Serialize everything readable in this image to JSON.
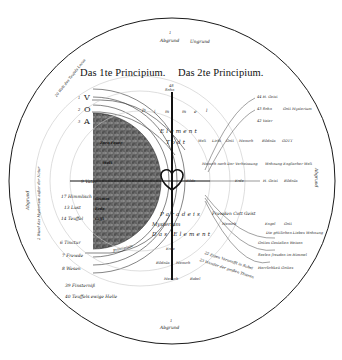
{
  "diagram": {
    "title_left": "Das 1te Principium.",
    "title_right": "Das 2te Principium.",
    "top": {
      "num": "1",
      "label": "Abgrund",
      "sub": "Ungrund"
    },
    "bottom": {
      "num": "1",
      "label": "Abgrund"
    },
    "left_edge": {
      "num": "1",
      "label": "Abgrund",
      "sub": "2 Wund das Mysterium außer der Natur"
    },
    "right_edge": {
      "label": "Abgrund"
    },
    "top_left_arc": "20 Welt des Teufels Locus",
    "center_axis": {
      "top_label": "Sohn",
      "top_num": "48",
      "heart_label": "Hertz"
    },
    "left_symbols": [
      {
        "num": "1",
        "glyph": "V"
      },
      {
        "num": "2",
        "glyph": "O"
      },
      {
        "num": "3",
        "glyph": "A"
      }
    ],
    "left_labels": [
      {
        "num": "9",
        "text": "Vater"
      },
      {
        "num": "17",
        "text": "Himmlisch"
      },
      {
        "num": "13",
        "text": "Lust"
      },
      {
        "num": "14",
        "text": "Teuffel"
      },
      {
        "num": "6",
        "text": "Tinctur"
      },
      {
        "num": "7",
        "text": "Frewde"
      },
      {
        "num": "8",
        "text": "Wesen"
      },
      {
        "num": "39",
        "text": "Finsterniß"
      },
      {
        "num": "40",
        "text": "Teuffels ewige Helle"
      }
    ],
    "dark_hemisphere_labels": [
      "Zorn Feuer",
      "Welt",
      "Erde",
      "Grimm",
      "Teufel",
      "Gifft",
      "Principium"
    ],
    "arc_letters": [
      "D",
      "i",
      "m",
      "m",
      "e",
      "l"
    ],
    "middle_band": {
      "element": "Element",
      "tod": "Todt",
      "paradeis": "Paradeis",
      "mysterium": "Mysterium",
      "das_element": "Das Element"
    },
    "right_top_labels": [
      {
        "num": "44",
        "text": "H. Geist"
      },
      {
        "num": "43",
        "text": "Sohn",
        "extra": "Gott Mysterium"
      },
      {
        "num": "42",
        "text": "Vater"
      }
    ],
    "right_row1": [
      {
        "num": "29",
        "text": "Welt"
      },
      {
        "num": "30",
        "text": "Licht"
      },
      {
        "num": "31",
        "text": "Gott"
      },
      {
        "num": "32",
        "text": "Mensch"
      },
      {
        "num": "33",
        "text": "Bildnüs"
      },
      {
        "num": "34",
        "text": "GOTT"
      }
    ],
    "right_row2": [
      {
        "num": "35",
        "text": "Mensch nach Der Verheissung"
      },
      {
        "num": "36",
        "text": "Wohnung Englischer Welt"
      }
    ],
    "right_row3": [
      {
        "num": "37",
        "text": "Bilde"
      },
      {
        "num": "38",
        "text": "Erde"
      },
      {
        "num": "15",
        "text": "H. Geist"
      },
      {
        "num": "16",
        "text": "Bildnüs"
      }
    ],
    "lower_center": [
      {
        "num": "18",
        "text": "Frewden Cott Geist"
      },
      {
        "num": "52",
        "text": "Mensch"
      },
      {
        "num": "53",
        "text": "Engel"
      },
      {
        "num": "54",
        "text": "Gott"
      },
      {
        "num": "55",
        "text": "Die göttlichen Liebes Wohnung"
      },
      {
        "num": "45",
        "text": "Erde"
      },
      {
        "num": "46",
        "text": "Bildnüs"
      },
      {
        "num": "47",
        "text": "Mensch"
      },
      {
        "num": "26",
        "text": "Mensch"
      },
      {
        "num": "27",
        "text": "Babel"
      }
    ],
    "lower_right": [
      {
        "num": "49",
        "text": "Gottes Gestalten Weisen"
      },
      {
        "num": "50",
        "text": "Seelen freuden im Himmel"
      },
      {
        "num": "51",
        "text": "Herrlichkeit Gottes"
      }
    ],
    "diagonal_notes": [
      "22 Eigen Vernunfft in Babel",
      "23 Wunder der großen Thieren"
    ]
  },
  "colors": {
    "ink": "#1a1a1a",
    "paper": "#ffffff",
    "dark_hemisphere": "#6e6e6e",
    "light_arc": "#c8c8c8"
  }
}
